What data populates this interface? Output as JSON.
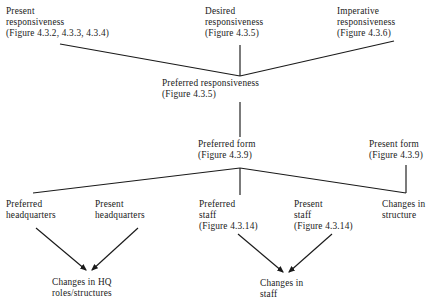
{
  "diagram": {
    "type": "tree-flowchart",
    "background_color": "#ffffff",
    "line_color": "#1a1a1a",
    "text_color": "#1a1a1a",
    "nodes": [
      {
        "id": "present-responsiveness",
        "lines": [
          "Present",
          "responsiveness",
          "(Figure 4.3.2, 4.3.3, 4.3.4)"
        ],
        "x": 6,
        "y": 6,
        "align": "left"
      },
      {
        "id": "desired-responsiveness",
        "lines": [
          "Desired",
          "responsiveness",
          "(Figure 4.3.5)"
        ],
        "x": 205,
        "y": 6,
        "align": "left"
      },
      {
        "id": "imperative-responsiveness",
        "lines": [
          "Imperative",
          "responsiveness",
          "(Figure 4.3.6)"
        ],
        "x": 337,
        "y": 6,
        "align": "left"
      },
      {
        "id": "preferred-responsiveness",
        "lines": [
          "Preferred responsiveness",
          "(Figure 4.3.5)"
        ],
        "x": 162,
        "y": 78,
        "align": "left"
      },
      {
        "id": "preferred-form",
        "lines": [
          "Preferred form",
          "(Figure 4.3.9)"
        ],
        "x": 198,
        "y": 139,
        "align": "left"
      },
      {
        "id": "present-form",
        "lines": [
          "Present form",
          "(Figure 4.3.9)"
        ],
        "x": 369,
        "y": 139,
        "align": "left"
      },
      {
        "id": "preferred-headquarters",
        "lines": [
          "Preferred",
          "headquarters"
        ],
        "x": 6,
        "y": 199,
        "align": "left"
      },
      {
        "id": "present-headquarters",
        "lines": [
          "Present",
          "headquarters"
        ],
        "x": 95,
        "y": 199,
        "align": "left"
      },
      {
        "id": "preferred-staff",
        "lines": [
          "Preferred",
          "staff",
          "(Figure 4.3.14)"
        ],
        "x": 199,
        "y": 199,
        "align": "left"
      },
      {
        "id": "present-staff",
        "lines": [
          "Present",
          "staff",
          "(Figure 4.3.14)"
        ],
        "x": 294,
        "y": 199,
        "align": "left"
      },
      {
        "id": "changes-in-structure",
        "lines": [
          "Changes in",
          "structure"
        ],
        "x": 382,
        "y": 199,
        "align": "left"
      },
      {
        "id": "changes-in-hq-roles",
        "lines": [
          "Changes in HQ",
          "roles/structures"
        ],
        "x": 52,
        "y": 277,
        "align": "left"
      },
      {
        "id": "changes-in-staff",
        "lines": [
          "Changes in",
          "staff"
        ],
        "x": 260,
        "y": 278,
        "align": "left"
      }
    ],
    "edges": [
      {
        "id": "edge-present-resp-to-preferred-resp",
        "from": "present-responsiveness",
        "to": "preferred-responsiveness",
        "arrow": false
      },
      {
        "id": "edge-desired-resp-to-preferred-resp",
        "from": "desired-responsiveness",
        "to": "preferred-responsiveness",
        "arrow": false
      },
      {
        "id": "edge-imperative-resp-to-preferred-resp",
        "from": "imperative-responsiveness",
        "to": "preferred-responsiveness",
        "arrow": false
      },
      {
        "id": "edge-preferred-resp-to-preferred-form",
        "from": "preferred-responsiveness",
        "to": "preferred-form",
        "arrow": false
      },
      {
        "id": "edge-preferred-form-to-preferred-headquarters",
        "from": "preferred-form",
        "to": "preferred-headquarters",
        "arrow": false
      },
      {
        "id": "edge-preferred-form-to-preferred-staff",
        "from": "preferred-form",
        "to": "preferred-staff",
        "arrow": false
      },
      {
        "id": "edge-preferred-form-to-changes-in-structure",
        "from": "preferred-form",
        "to": "changes-in-structure",
        "arrow": false
      },
      {
        "id": "edge-present-form-to-changes-in-structure",
        "from": "present-form",
        "to": "changes-in-structure",
        "arrow": false
      },
      {
        "id": "edge-preferred-hq-to-changes-hq",
        "from": "preferred-headquarters",
        "to": "changes-in-hq-roles",
        "arrow": true
      },
      {
        "id": "edge-present-hq-to-changes-hq",
        "from": "present-headquarters",
        "to": "changes-in-hq-roles",
        "arrow": true
      },
      {
        "id": "edge-preferred-staff-to-changes-staff",
        "from": "preferred-staff",
        "to": "changes-in-staff",
        "arrow": true
      },
      {
        "id": "edge-present-staff-to-changes-staff",
        "from": "present-staff",
        "to": "changes-in-staff",
        "arrow": true
      }
    ]
  }
}
